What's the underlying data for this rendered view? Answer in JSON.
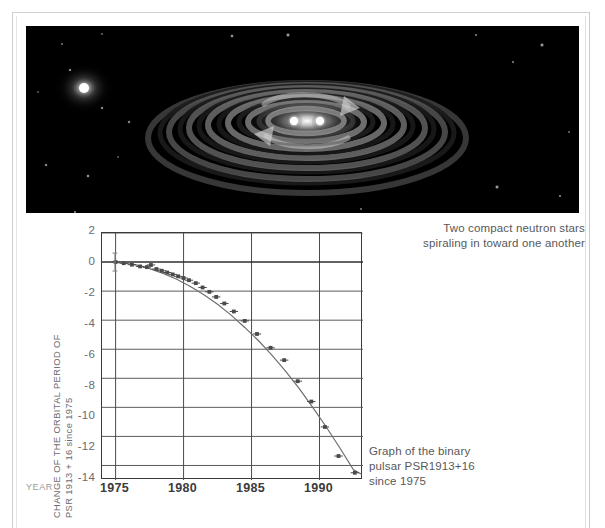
{
  "figure": {
    "illustration_alt": "two-neutron-stars-gravitational-waves",
    "background_color": "#000000"
  },
  "captions": {
    "top": "Two compact neutron stars spiraling in toward one another",
    "top_line1": "Two compact neutron stars",
    "top_line2": "spiraling in toward one another",
    "bottom": "Graph of the binary pulsar PSR1913+16 since 1975",
    "bottom_line1": "Graph of the binary",
    "bottom_line2": "pulsar PSR1913+16",
    "bottom_line3": "since 1975"
  },
  "axis": {
    "year_label": "YEAR",
    "ytitle_line1": "CHANGE OF THE ORBITAL PERIOD OF",
    "ytitle_line2": "PSR 1913 + 16 since 1975"
  },
  "colors": {
    "curve": "#6e6e70",
    "point": "#4a4a4c",
    "grid": "#4b4b4d",
    "frame": "#3a3a3a",
    "text": "#58585a",
    "muted_text": "#9a9a9c",
    "page_border": "#cfcfcf"
  },
  "chart_data": {
    "type": "line",
    "title": "Graph of the binary pulsar PSR1913+16 since 1975",
    "xlabel": "YEAR",
    "ylabel": "CHANGE OF THE ORBITAL PERIOD OF PSR 1913 + 16 since 1975",
    "xlim": [
      1974.0,
      1993.2
    ],
    "ylim": [
      -15.0,
      2.0
    ],
    "xticks": [
      1975,
      1980,
      1985,
      1990
    ],
    "xtick_labels": [
      "1975",
      "1980",
      "1985",
      "1990"
    ],
    "yticks": [
      2,
      0,
      -2,
      -4,
      -6,
      -8,
      -10,
      -12,
      -14
    ],
    "ytick_labels": [
      "2",
      "0",
      "-2",
      "-4",
      "-6",
      "-8",
      "-10",
      "-12",
      "-14"
    ],
    "grid": true,
    "legend": false,
    "series": [
      {
        "name": "General relativity prediction",
        "kind": "line",
        "x": [
          1974.7,
          1975.5,
          1976.5,
          1977.5,
          1978.5,
          1979.5,
          1980.5,
          1981.5,
          1982.5,
          1983.5,
          1984.5,
          1985.5,
          1986.5,
          1987.5,
          1988.5,
          1989.5,
          1990.5,
          1991.5,
          1992.5,
          1993.1
        ],
        "y": [
          0.0,
          -0.05,
          -0.2,
          -0.45,
          -0.78,
          -1.18,
          -1.68,
          -2.25,
          -2.9,
          -3.65,
          -4.5,
          -5.4,
          -6.4,
          -7.5,
          -8.7,
          -10.0,
          -11.35,
          -12.8,
          -14.3,
          -14.6
        ]
      },
      {
        "name": "Observed cumulative shift of periastron time",
        "kind": "scatter",
        "x": [
          1975.0,
          1975.6,
          1976.2,
          1976.8,
          1977.3,
          1977.6,
          1978.0,
          1978.4,
          1978.8,
          1979.2,
          1979.6,
          1980.0,
          1980.4,
          1980.9,
          1981.4,
          1981.9,
          1982.4,
          1983.0,
          1983.7,
          1984.5,
          1985.4,
          1986.4,
          1987.4,
          1988.4,
          1989.4,
          1990.4,
          1991.4,
          1992.6
        ],
        "y": [
          0.0,
          -0.08,
          -0.18,
          -0.3,
          -0.35,
          -0.2,
          -0.48,
          -0.6,
          -0.72,
          -0.85,
          -0.98,
          -1.1,
          -1.25,
          -1.45,
          -1.75,
          -2.05,
          -2.4,
          -2.85,
          -3.4,
          -4.05,
          -4.95,
          -5.9,
          -6.75,
          -8.2,
          -9.6,
          -11.35,
          -13.35,
          -14.5
        ]
      }
    ]
  }
}
